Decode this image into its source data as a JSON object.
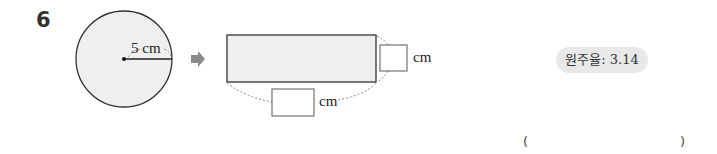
{
  "problem": {
    "number": "6",
    "circle": {
      "radius_label": "5 cm"
    },
    "arrow": "➡",
    "rectangle": {
      "height_unit": "cm",
      "width_unit": "cm"
    },
    "badge": "원주율: 3.14",
    "answer": {
      "open": "(",
      "close": ")"
    }
  },
  "colors": {
    "shape_fill": "#efefef",
    "stroke": "#333333",
    "badge_bg": "#e8e8e8",
    "arrow": "#888888"
  }
}
